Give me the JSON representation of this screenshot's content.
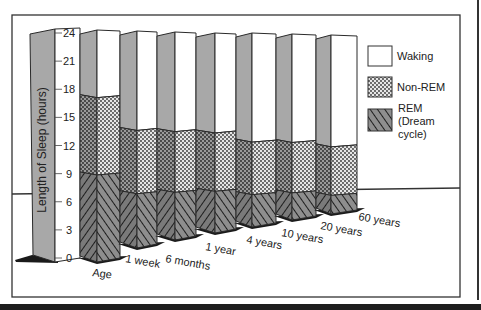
{
  "chart_data": {
    "type": "bar",
    "stacked": true,
    "style": "3d-perspective",
    "title": "",
    "xlabel": "Age",
    "ylabel": "Length of Sleep (hours)",
    "ylim": [
      0,
      24
    ],
    "yticks": [
      0,
      3,
      6,
      9,
      12,
      15,
      18,
      21,
      24
    ],
    "categories": [
      "1 week",
      "6 months",
      "1 year",
      "4 years",
      "10 years",
      "20 years",
      "60 years"
    ],
    "series": [
      {
        "name": "REM (Dream cycle)",
        "pattern": "diagonal-hatch",
        "values": [
          9.0,
          6.0,
          5.5,
          5.0,
          4.0,
          3.5,
          2.5
        ]
      },
      {
        "name": "Non-REM",
        "pattern": "dots",
        "values": [
          8.0,
          7.0,
          7.0,
          7.0,
          6.5,
          6.5,
          6.5
        ]
      },
      {
        "name": "Waking",
        "pattern": "white",
        "values": [
          7.0,
          11.0,
          11.5,
          12.0,
          13.5,
          14.0,
          15.0
        ]
      }
    ],
    "legend": {
      "position": "right",
      "entries": [
        "Waking",
        "Non-REM",
        "REM (Dream cycle)"
      ]
    },
    "grid": false
  },
  "axis": {
    "title": "Length of Sleep (hours)",
    "x_title": "Age",
    "ticks": [
      "0",
      "3",
      "6",
      "9",
      "12",
      "15",
      "18",
      "21",
      "24"
    ]
  },
  "legend": {
    "waking": "Waking",
    "nonrem": "Non-REM",
    "rem_line1": "REM",
    "rem_line2": "(Dream",
    "rem_line3": "cycle)"
  },
  "labels": [
    "1 week",
    "6 months",
    "1 year",
    "4 years",
    "10 years",
    "20 years",
    "60 years"
  ],
  "colors": {
    "side": "#a8a8a8",
    "outline": "#2a2a2a",
    "floor_shadow": "#1a1a1a",
    "rem_fill": "#8c8c8c"
  }
}
